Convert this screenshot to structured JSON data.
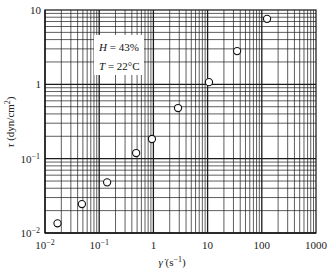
{
  "chart_data": {
    "type": "scatter",
    "title": "",
    "xlabel": "γ̇ (s⁻¹)",
    "ylabel": "τ (dyn/cm²)",
    "xscale": "log",
    "yscale": "log",
    "xlim": [
      0.01,
      1000
    ],
    "ylim": [
      0.01,
      10
    ],
    "x_tick_labels": [
      {
        "value": 0.01,
        "base": "10",
        "exp": "−2"
      },
      {
        "value": 0.1,
        "base": "10",
        "exp": "−1"
      },
      {
        "value": 1,
        "base": "1",
        "exp": ""
      },
      {
        "value": 10,
        "base": "10",
        "exp": ""
      },
      {
        "value": 100,
        "base": "100",
        "exp": ""
      },
      {
        "value": 1000,
        "base": "1000",
        "exp": ""
      }
    ],
    "y_tick_labels": [
      {
        "value": 0.01,
        "base": "10",
        "exp": "−2"
      },
      {
        "value": 0.1,
        "base": "10",
        "exp": "−1"
      },
      {
        "value": 1,
        "base": "1",
        "exp": ""
      },
      {
        "value": 10,
        "base": "10",
        "exp": ""
      }
    ],
    "grid": true,
    "legend": null,
    "marker": "open-circle",
    "series": [
      {
        "name": "H = 43%, T = 22°C",
        "x": [
          0.017,
          0.048,
          0.14,
          0.48,
          0.94,
          2.85,
          10.6,
          35,
          125
        ],
        "y": [
          0.0135,
          0.0245,
          0.048,
          0.119,
          0.184,
          0.48,
          1.07,
          2.8,
          7.6
        ]
      }
    ],
    "annotations": [
      {
        "text_var": "H",
        "text_rest": " = 43%"
      },
      {
        "text_var": "T",
        "text_rest": " = 22°C"
      }
    ]
  },
  "labels": {
    "xlabel_symbol": "γ̇",
    "xlabel_unit": " (s",
    "xlabel_exp": "−1",
    "xlabel_close": ")",
    "ylabel_symbol": "τ",
    "ylabel_unit": " (dyn/cm",
    "ylabel_exp": "2",
    "ylabel_close": ")",
    "anno1_var": "H",
    "anno1_rest": " = 43%",
    "anno2_var": "T",
    "anno2_rest": " = 22°C"
  },
  "style": {
    "grid_color": "#1a1a1a",
    "marker_stroke": "#111111",
    "background": "#ffffff"
  }
}
